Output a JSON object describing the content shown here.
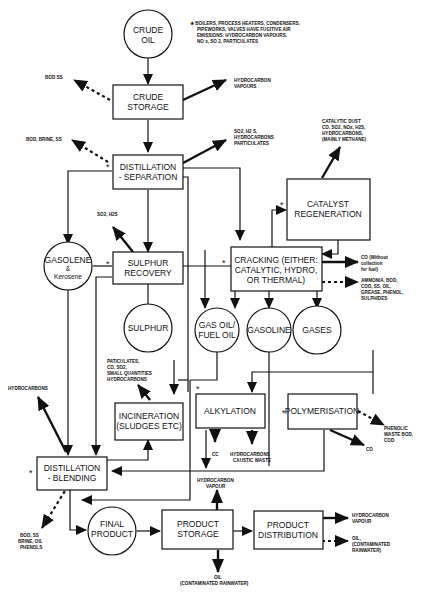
{
  "diagram": {
    "nodes": {
      "crude_oil": [
        "CRUDE",
        "OIL"
      ],
      "crude_storage": [
        "CRUDE",
        "STORAGE"
      ],
      "distillation_separation": [
        "DISTILLATION",
        "- SEPARATION"
      ],
      "catalyst_regeneration": [
        "CATALYST",
        "REGENERATION"
      ],
      "gasolene_kerosene": [
        "GASOLENE",
        "&",
        "Kerosene"
      ],
      "sulphur_recovery": [
        "SULPHUR",
        "RECOVERY"
      ],
      "sulphur": [
        "SULPHUR"
      ],
      "cracking": [
        "CRACKING (EITHER:",
        "CATALYTIC, HYDRO,",
        "OR THERMAL)"
      ],
      "gas_oil": [
        "GAS OIL/",
        "FUEL OIL"
      ],
      "gasoline": [
        "GASOLINE"
      ],
      "gases": [
        "GASES"
      ],
      "incineration": [
        "INCINERATION",
        "(SLUDGES ETC)"
      ],
      "alkylation": [
        "ALKYLATION"
      ],
      "polymerisation": [
        "POLYMERISATION"
      ],
      "distillation_blending": [
        "DISTILLATION",
        "- BLENDING"
      ],
      "final_product": [
        "FINAL",
        "PRODUCT"
      ],
      "product_storage": [
        "PRODUCT",
        "STORAGE"
      ],
      "product_distribution": [
        "PRODUCT",
        "DISTRIBUTION"
      ]
    },
    "footnote": [
      "★ BOILERS, PROCESS HEATERS, CONDENSERS,",
      "PIPEWORKS, VALVES HAVE FUGITIVE AIR",
      "EMISSIONS: HYDROCARBON VAPOURS.",
      "NO x, SO 2, PARTICULATES"
    ],
    "emissions": {
      "crude_storage_water": [
        "BOD SS"
      ],
      "crude_storage_air": [
        "HYDROCARBON",
        "VAPOURS"
      ],
      "dist_sep_water": [
        "BOD, BRINE, SS"
      ],
      "dist_sep_air": [
        "SO2, H2 S,",
        "HYDROCARBONS",
        "PARTICULATES"
      ],
      "catalyst_air": [
        "CATALYTIC DUST",
        "CO, SO2, NOx, H2S,",
        "HYDROCARBONS,",
        "(MAINLY METHANE)"
      ],
      "sulphur_recovery_air": [
        "SO2, H2S"
      ],
      "cracking_co": [
        "CO (Without",
        "collection",
        "for fuel)"
      ],
      "cracking_water": [
        "AMMONIA, BOD,",
        "COD, SS, OIL,",
        "GREASE, PHENOL,",
        "SULPHIDES"
      ],
      "incineration_air": [
        "PATICULATES,",
        "CO, SO2,",
        "SMALL QUANTITIES",
        "HYDROCARBONS"
      ],
      "blending_air": [
        "HYDROCARBONS"
      ],
      "alkylation_cc": [
        "CC"
      ],
      "alkylation_waste": [
        "HYDROCARBONS",
        "CAUSTIC WASTE"
      ],
      "polymerisation_water": [
        "PHENOLIC",
        "WASTE BOD,",
        "COD"
      ],
      "polymerisation_co": [
        "CO"
      ],
      "storage_vapour": [
        "HYDROCARBON",
        "VAPOUR"
      ],
      "blending_water": [
        "BOD, SS",
        "BRINE, OIL",
        "PHENOLS"
      ],
      "storage_oil": [
        "OIL",
        "(CONTAMINATED RAINWATER)"
      ],
      "distribution_vapour": [
        "HYDROCARBON",
        "VAPOUR"
      ],
      "distribution_oil": [
        "OIL,",
        "(CONTAMINATED",
        "RAINWATER)"
      ]
    },
    "star": "*"
  }
}
